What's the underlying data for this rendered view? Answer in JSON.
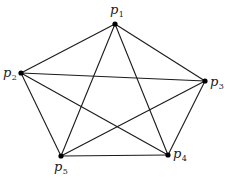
{
  "diagram": {
    "type": "complete-graph-K5",
    "nodes": [
      {
        "id": "p1",
        "base": "p",
        "sub": "1",
        "x": 115,
        "y": 24,
        "lx": 110,
        "ly": 14
      },
      {
        "id": "p2",
        "base": "p",
        "sub": "2",
        "x": 21,
        "y": 73,
        "lx": 3,
        "ly": 77
      },
      {
        "id": "p3",
        "base": "p",
        "sub": "3",
        "x": 205,
        "y": 81,
        "lx": 210,
        "ly": 86
      },
      {
        "id": "p4",
        "base": "p",
        "sub": "4",
        "x": 168,
        "y": 155,
        "lx": 173,
        "ly": 158
      },
      {
        "id": "p5",
        "base": "p",
        "sub": "5",
        "x": 61,
        "y": 156,
        "lx": 54,
        "ly": 171
      }
    ],
    "edges": [
      [
        "p1",
        "p2"
      ],
      [
        "p1",
        "p3"
      ],
      [
        "p1",
        "p4"
      ],
      [
        "p1",
        "p5"
      ],
      [
        "p2",
        "p3"
      ],
      [
        "p2",
        "p4"
      ],
      [
        "p2",
        "p5"
      ],
      [
        "p3",
        "p4"
      ],
      [
        "p3",
        "p5"
      ],
      [
        "p4",
        "p5"
      ]
    ],
    "colors": {
      "line": "#1a1a1a",
      "node": "#000000",
      "background": "#ffffff"
    }
  }
}
